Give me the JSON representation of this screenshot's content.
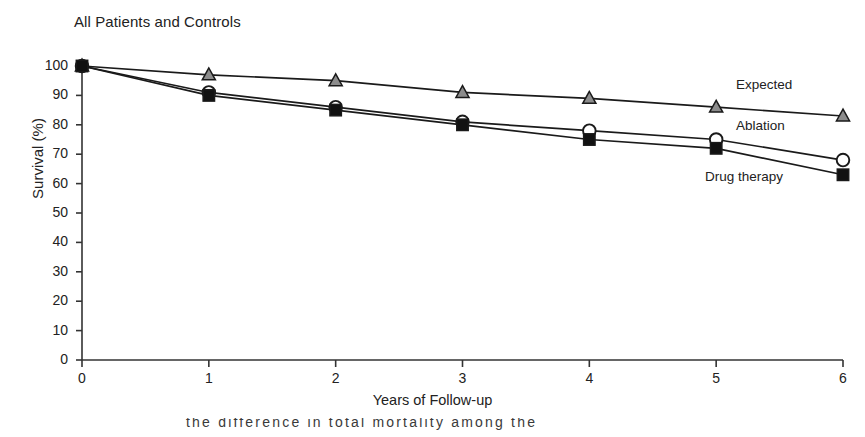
{
  "figure": {
    "title": "All Patients and Controls",
    "xlabel": "Years of Follow-up",
    "ylabel": "Survival (%)",
    "caption_fragment": "the difference in total mortality among the"
  },
  "axes": {
    "y_ticks": [
      "100",
      "90",
      "80",
      "70",
      "60",
      "50",
      "40",
      "30",
      "20",
      "10",
      "0"
    ],
    "x_ticks": [
      "0",
      "1",
      "2",
      "3",
      "4",
      "5",
      "6"
    ]
  },
  "legend": {
    "expected": "Expected",
    "ablation": "Ablation",
    "drug_therapy": "Drug therapy"
  },
  "colors": {
    "line": "#1a1a1a",
    "expected_marker_fill": "#8c8c8c",
    "ablation_marker_fill": "#ffffff",
    "drug_marker_fill": "#111111",
    "axis": "#333333",
    "text": "#222222"
  },
  "chart_data": {
    "type": "line",
    "title": "All Patients and Controls",
    "xlabel": "Years of Follow-up",
    "ylabel": "Survival (%)",
    "x": [
      0,
      1,
      2,
      3,
      4,
      5,
      6
    ],
    "xlim": [
      0,
      6
    ],
    "ylim": [
      0,
      100
    ],
    "grid": false,
    "legend_position": "right-inline",
    "series": [
      {
        "name": "Expected",
        "marker": "triangle",
        "marker_fill": "#8c8c8c",
        "values": [
          100,
          97,
          95,
          91,
          89,
          86,
          83
        ]
      },
      {
        "name": "Ablation",
        "marker": "circle",
        "marker_fill": "#ffffff",
        "values": [
          100,
          91,
          86,
          81,
          78,
          75,
          68
        ]
      },
      {
        "name": "Drug therapy",
        "marker": "square",
        "marker_fill": "#111111",
        "values": [
          100,
          90,
          85,
          80,
          75,
          72,
          63
        ]
      }
    ]
  }
}
